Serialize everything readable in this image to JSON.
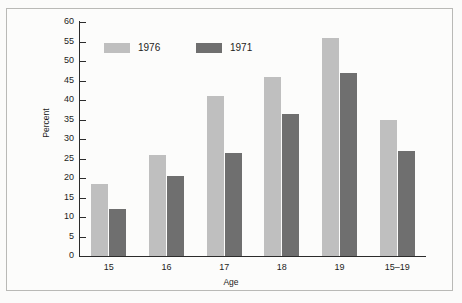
{
  "chart_data": {
    "type": "bar",
    "title": "",
    "xlabel": "Age",
    "ylabel": "Percent",
    "categories": [
      "15",
      "16",
      "17",
      "18",
      "19",
      "15–19"
    ],
    "series": [
      {
        "name": "1976",
        "color": "#bfbfbf",
        "values": [
          18.5,
          26,
          41,
          46,
          56,
          35
        ]
      },
      {
        "name": "1971",
        "color": "#6f6f6f",
        "values": [
          12,
          20.5,
          26.5,
          36.5,
          47,
          27
        ]
      }
    ],
    "ylim": [
      0,
      60
    ],
    "ytick_labels": [
      "0",
      "5",
      "10",
      "15",
      "20",
      "25",
      "30",
      "35",
      "40",
      "45",
      "50",
      "55",
      "60"
    ],
    "ytick_values": [
      0,
      5,
      10,
      15,
      20,
      25,
      30,
      35,
      40,
      45,
      50,
      55,
      60
    ],
    "grid": false,
    "legend_position": "top-left-inside",
    "legend": [
      "1976",
      "1971"
    ]
  }
}
